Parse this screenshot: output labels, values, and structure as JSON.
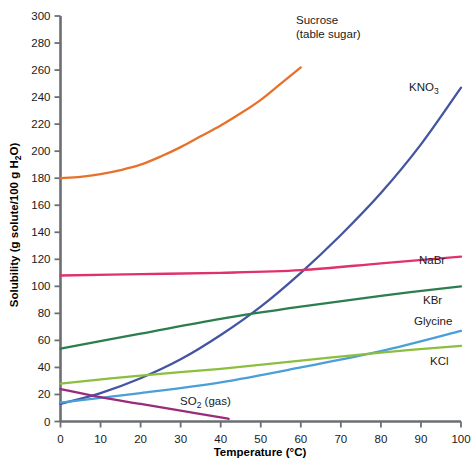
{
  "chart_data": {
    "type": "line",
    "title": "",
    "xlabel": "Temperature (°C)",
    "ylabel": "Solubility (g solute/100 g H₂O)",
    "xlim": [
      0,
      100
    ],
    "ylim": [
      0,
      300
    ],
    "xticks": [
      0,
      10,
      20,
      30,
      40,
      50,
      60,
      70,
      80,
      90,
      100
    ],
    "yticks": [
      0,
      20,
      40,
      60,
      80,
      100,
      120,
      140,
      160,
      180,
      200,
      220,
      240,
      260,
      280,
      300
    ],
    "grid": false,
    "legend": "inline-labels",
    "series": [
      {
        "name": "Sucrose (table sugar)",
        "label_line1": "Sucrose",
        "label_line2": "(table sugar)",
        "color": "#E8712A",
        "x": [
          0,
          5,
          10,
          15,
          20,
          25,
          30,
          35,
          40,
          45,
          50,
          55,
          60
        ],
        "values": [
          180,
          181,
          183,
          186,
          190,
          196,
          203,
          211,
          219,
          228,
          238,
          250,
          262
        ]
      },
      {
        "name": "KNO3",
        "label_text": "KNO",
        "label_sub": "3",
        "color": "#4455A0",
        "x": [
          0,
          10,
          20,
          30,
          40,
          50,
          60,
          70,
          80,
          90,
          100
        ],
        "values": [
          13,
          21,
          32,
          46,
          64,
          85,
          110,
          138,
          169,
          205,
          247
        ]
      },
      {
        "name": "NaBr",
        "label_text": "NaBr",
        "color": "#E0316A",
        "x": [
          0,
          20,
          40,
          60,
          80,
          100
        ],
        "values": [
          108,
          109,
          110,
          112,
          117,
          122
        ]
      },
      {
        "name": "KBr",
        "label_text": "KBr",
        "color": "#2E7D4F",
        "x": [
          0,
          20,
          40,
          60,
          80,
          100
        ],
        "values": [
          54,
          65,
          76,
          85,
          93,
          100
        ]
      },
      {
        "name": "Glycine",
        "label_text": "Glycine",
        "color": "#4A9FD8",
        "x": [
          0,
          20,
          40,
          60,
          80,
          100
        ],
        "values": [
          14,
          21,
          29,
          40,
          52,
          67
        ]
      },
      {
        "name": "KCl",
        "label_text": "KCl",
        "color": "#8CBE3F",
        "x": [
          0,
          20,
          40,
          60,
          80,
          100
        ],
        "values": [
          28,
          34,
          39,
          45,
          51,
          56
        ]
      },
      {
        "name": "SO2 (gas)",
        "label_text": "SO",
        "label_sub": "2",
        "label_suffix": " (gas)",
        "color": "#9C2A7A",
        "x": [
          0,
          10,
          20,
          30,
          40,
          42
        ],
        "values": [
          24,
          18,
          13,
          8,
          3,
          2
        ]
      }
    ]
  },
  "axes": {
    "x_title": "Temperature (°C)",
    "y_title_main": "Solubility (g solute/100 g H",
    "y_title_sub": "2",
    "y_title_tail": "O)",
    "tick_color": "#6b6f73",
    "axis_color": "#6b6f73"
  },
  "xtick_labels": [
    "0",
    "10",
    "20",
    "30",
    "40",
    "50",
    "60",
    "70",
    "80",
    "90",
    "100"
  ],
  "ytick_labels": [
    "0",
    "20",
    "40",
    "60",
    "80",
    "100",
    "120",
    "140",
    "160",
    "180",
    "200",
    "220",
    "240",
    "260",
    "280",
    "300"
  ],
  "series_labels": {
    "sucrose_l1": "Sucrose",
    "sucrose_l2": "(table sugar)",
    "kno3": "KNO",
    "kno3_sub": "3",
    "nabr": "NaBr",
    "kbr": "KBr",
    "glycine": "Glycine",
    "kcl": "KCl",
    "so2": "SO",
    "so2_sub": "2",
    "so2_suffix": " (gas)"
  }
}
